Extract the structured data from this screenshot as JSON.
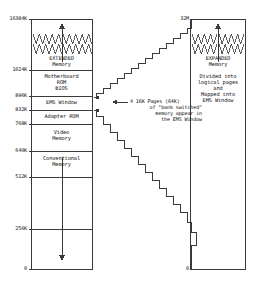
{
  "diagram": {
    "title_semantic": "dos-memory-map-ems-expanded-memory",
    "stroke_color": "#3a3a3a",
    "text_color": "#111111",
    "background": "#ffffff"
  },
  "left_column": {
    "name": "system-memory-map",
    "top_label": "16384K",
    "bottom_label": "0",
    "ticks": [
      {
        "label": "16384K",
        "value": 16384
      },
      {
        "label": "1024K",
        "value": 1024
      },
      {
        "label": "896K",
        "value": 896
      },
      {
        "label": "832K",
        "value": 832
      },
      {
        "label": "768K",
        "value": 768
      },
      {
        "label": "640K",
        "value": 640
      },
      {
        "label": "512K",
        "value": 512
      },
      {
        "label": "256K",
        "value": 256
      },
      {
        "label": "0",
        "value": 0
      }
    ],
    "blocks": [
      {
        "id": "extended-memory",
        "lines": [
          "EXTENDED",
          "Memory"
        ],
        "from": 1024,
        "to": 16384,
        "break_squiggle": true,
        "arrow": "up"
      },
      {
        "id": "motherboard-rom-bios",
        "lines": [
          "Motherboard",
          "ROM",
          "BIOS"
        ],
        "from": 896,
        "to": 1024,
        "break_squiggle": false,
        "arrow": "none"
      },
      {
        "id": "ems-window",
        "lines": [
          "EMS Window"
        ],
        "from": 832,
        "to": 896,
        "break_squiggle": false,
        "arrow": "none"
      },
      {
        "id": "adapter-rom",
        "lines": [
          "Adapter ROM"
        ],
        "from": 768,
        "to": 832,
        "break_squiggle": false,
        "arrow": "none"
      },
      {
        "id": "video-memory",
        "lines": [
          "Video",
          "Memory"
        ],
        "from": 640,
        "to": 768,
        "break_squiggle": false,
        "arrow": "none"
      },
      {
        "id": "conventional-memory",
        "lines": [
          "Conventional",
          "Memory"
        ],
        "from": 0,
        "to": 640,
        "break_squiggle": false,
        "arrow": "down"
      }
    ]
  },
  "right_column": {
    "name": "expanded-memory-map",
    "top_label": "32M",
    "bottom_label": "0",
    "block": {
      "id": "expanded-memory",
      "heading": [
        "EXPANDED",
        "Memory"
      ],
      "body": [
        "Divided into",
        "logical pages",
        "and",
        "Mapped into",
        "EMS Window"
      ],
      "break_squiggle": true,
      "arrow": "up"
    }
  },
  "annotation": {
    "name": "bank-switch-callout",
    "lines": [
      "4 16K Pages (64K)",
      "of \"bank switched\"",
      "memory appear in",
      "the EMS Window"
    ],
    "arrow": "left-pointing-to-ems-window"
  },
  "connectors": {
    "name": "staircase-mapping-lines",
    "description": "two stepped lines converging from the EMS Window band to the top and bottom of the expanded memory column"
  }
}
